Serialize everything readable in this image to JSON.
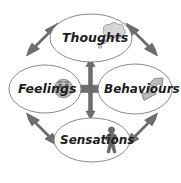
{
  "diagram": {
    "style": "hand-drawn",
    "background_color": "#ffffff",
    "outline_color": "#7d7d7d",
    "arrow_color": "#6e6e6e",
    "text_color": "#1d1d1d",
    "nodes": [
      {
        "id": "thoughts",
        "label": "Thoughts",
        "position": "top",
        "icon": "thought-bubble-icon",
        "cx": 91,
        "cy": 38,
        "rx": 41,
        "ry": 24
      },
      {
        "id": "feelings",
        "label": "Feelings",
        "position": "left",
        "icon": "sad-face-icon",
        "cx": 45,
        "cy": 89,
        "rx": 36,
        "ry": 24
      },
      {
        "id": "behaviours",
        "label": "Behaviours",
        "position": "right",
        "icon": "pointing-hand-icon",
        "cx": 135,
        "cy": 89,
        "rx": 37,
        "ry": 25
      },
      {
        "id": "sensations",
        "label": "Sensations",
        "position": "bottom",
        "icon": "standing-person-icon",
        "cx": 92,
        "cy": 140,
        "rx": 38,
        "ry": 22
      }
    ],
    "connectors": [
      {
        "id": "thoughts-feelings",
        "name": "arrow-thoughts-feelings",
        "kind": "double-headed-diagonal"
      },
      {
        "id": "thoughts-behaviours",
        "name": "arrow-thoughts-behaviours",
        "kind": "double-headed-diagonal"
      },
      {
        "id": "feelings-sensations",
        "name": "arrow-feelings-sensations",
        "kind": "double-headed-diagonal"
      },
      {
        "id": "behaviours-sensations",
        "name": "arrow-behaviours-sensations",
        "kind": "double-headed-diagonal"
      },
      {
        "id": "center-cross",
        "name": "arrow-center-cross",
        "kind": "four-way-double-headed"
      }
    ]
  }
}
